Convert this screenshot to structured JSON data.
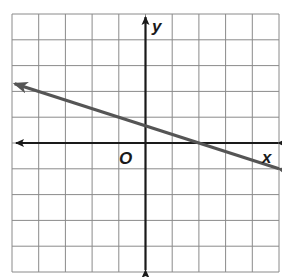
{
  "chart_data": {
    "type": "line",
    "title": "",
    "xlabel": "x",
    "ylabel": "y",
    "origin_label": "O",
    "xlim": [
      -5,
      5
    ],
    "ylim": [
      -5,
      5
    ],
    "grid": true,
    "grid_step": 1,
    "tick_labels_shown": false,
    "series": [
      {
        "name": "line",
        "equation": "y = -1/3 x + 2/3",
        "slope": -0.3333,
        "y_intercept": 0.6667,
        "x_intercept": 2,
        "points": [
          [
            -4,
            2
          ],
          [
            -1,
            1
          ],
          [
            2,
            0
          ],
          [
            5,
            -1
          ]
        ],
        "arrows_both_ends": true,
        "color": "#555555"
      }
    ]
  },
  "colors": {
    "grid": "#8a8a8a",
    "axes": "#1a1a1a",
    "line": "#555555"
  }
}
